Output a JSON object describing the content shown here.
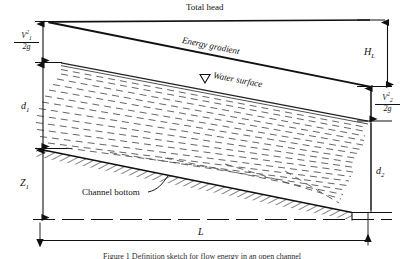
{
  "figure": {
    "type": "open-channel-flow-energy-diagram",
    "caption": "Figure 1 Definition sketch for flow energy in an open channel",
    "labels": {
      "total_head": "Total head",
      "energy_gradient": "Energy gradient",
      "water_surface": "Water surface",
      "channel_bottom": "Channel bottom",
      "water_surface_marker": "down-triangle-marker"
    },
    "dimensions": {
      "velocity_head_1": {
        "numerator": "V",
        "num_sup": "2",
        "num_sub": "1",
        "denominator": "2g",
        "text": "V1^2/2g"
      },
      "velocity_head_2": {
        "numerator": "V",
        "num_sup": "2",
        "num_sub": "2",
        "denominator": "2g",
        "text": "V2^2/2g"
      },
      "depth_1": {
        "symbol": "d",
        "sub": "1",
        "text": "d1"
      },
      "depth_2": {
        "symbol": "d",
        "sub": "2",
        "text": "d2"
      },
      "elevation_1": {
        "symbol": "Z",
        "sub": "1",
        "text": "Z1"
      },
      "head_loss": {
        "symbol": "H",
        "sub": "L",
        "text": "HL"
      },
      "length": {
        "symbol": "L",
        "text": "L"
      }
    },
    "colors": {
      "ink": "#111111",
      "background": "#ffffff",
      "water_dash": "#3a3a3a",
      "hatch": "#1a1a1a"
    }
  }
}
